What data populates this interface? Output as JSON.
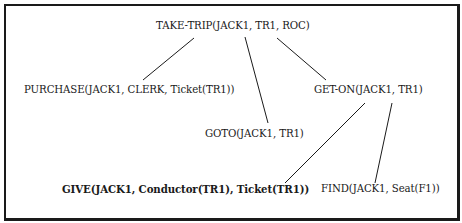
{
  "diagram": {
    "type": "tree",
    "nodes": [
      {
        "id": "take-trip",
        "label": "TAKE-TRIP(JACK1, TR1, ROC)",
        "bold": false
      },
      {
        "id": "purchase",
        "label": "PURCHASE(JACK1, CLERK, Ticket(TR1))",
        "bold": false
      },
      {
        "id": "get-on",
        "label": "GET-ON(JACK1, TR1)",
        "bold": false
      },
      {
        "id": "goto",
        "label": "GOTO(JACK1, TR1)",
        "bold": false
      },
      {
        "id": "give",
        "label": "GIVE(JACK1, Conductor(TR1), Ticket(TR1))",
        "bold": true
      },
      {
        "id": "find",
        "label": "FIND(JACK1, Seat(F1))",
        "bold": false
      }
    ],
    "edges": [
      {
        "from": "take-trip",
        "to": "purchase"
      },
      {
        "from": "take-trip",
        "to": "goto"
      },
      {
        "from": "take-trip",
        "to": "get-on"
      },
      {
        "from": "get-on",
        "to": "give"
      },
      {
        "from": "get-on",
        "to": "find"
      }
    ],
    "colors": {
      "ink": "#1a1a1a",
      "background": "#ffffff"
    }
  }
}
